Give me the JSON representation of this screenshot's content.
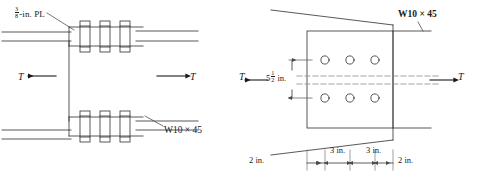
{
  "figure": {
    "line_color": "#3a3a3a",
    "hole_color": "#3a3a3a",
    "background": "#ffffff"
  },
  "left_view": {
    "name": "plan-view",
    "plate_label": {
      "numerator": "3",
      "denominator": "8",
      "suffix": "-in. PL"
    },
    "beam_label": "W10 × 45",
    "force_left": "T",
    "force_right": "T",
    "bolt_count_top": 3,
    "bolt_count_bottom": 3
  },
  "right_view": {
    "name": "section-view",
    "beam_label": "W10 × 45",
    "force_left": "T",
    "force_right": "T",
    "vertical_dimension": {
      "whole": "5",
      "numerator": "1",
      "denominator": "2",
      "unit": "in."
    },
    "horizontal_dimensions": [
      "2 in.",
      "3 in.",
      "3 in.",
      "2 in."
    ],
    "hole_rows": 2,
    "hole_cols": 3,
    "hole_total": 6
  }
}
